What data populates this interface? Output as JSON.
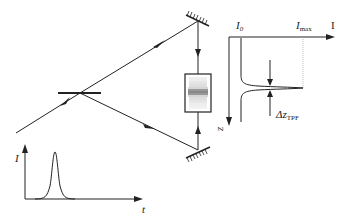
{
  "diagram": {
    "components": {
      "beam_splitter": {
        "label": "beam-splitter"
      },
      "mirror_top": {
        "label": "mirror"
      },
      "mirror_bottom": {
        "label": "mirror"
      },
      "sample_cell": {
        "label": "fluorescent cell with interference fringes"
      }
    },
    "pulse_inset": {
      "y_axis_label": "I",
      "x_axis_label": "t"
    },
    "profile_plot": {
      "x_axis_label": "I",
      "z_axis_label": "z",
      "baseline_label_main": "I",
      "baseline_label_sub": "0",
      "max_label_main": "I",
      "max_label_sub": "max",
      "width_label_main": "Δz",
      "width_label_sub": "TPF"
    },
    "colors": {
      "line": "#222222",
      "fringe": "#555555",
      "background": "#ffffff",
      "dotted": "#999999"
    }
  }
}
